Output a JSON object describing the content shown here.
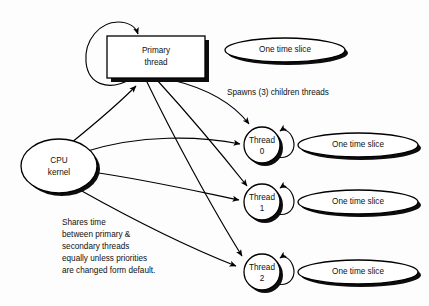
{
  "diagram": {
    "background_color": "#fdfdfd",
    "line_color": "#000000",
    "shadow_color": "#0d0d0d",
    "nodes": {
      "primary_thread": {
        "label_line1": "Primary",
        "label_line2": "thread",
        "shape": "rectangle"
      },
      "cpu_kernel": {
        "label_line1": "CPU",
        "label_line2": "kernel",
        "shape": "ellipse"
      },
      "thread0": {
        "label_line1": "Thread",
        "label_line2": "0",
        "shape": "circle"
      },
      "thread1": {
        "label_line1": "Thread",
        "label_line2": "1",
        "shape": "circle"
      },
      "thread2": {
        "label_line1": "Thread",
        "label_line2": "2",
        "shape": "circle"
      }
    },
    "time_slices": [
      {
        "label": "One time slice"
      },
      {
        "label": "One time slice"
      },
      {
        "label": "One time slice"
      },
      {
        "label": "One time slice"
      }
    ],
    "annotations": {
      "spawns": "Spawns (3) children threads",
      "note_lines": [
        "Shares time",
        "between primary &",
        "secondary threads",
        "equally unless priorities",
        "are changed form default."
      ]
    }
  }
}
